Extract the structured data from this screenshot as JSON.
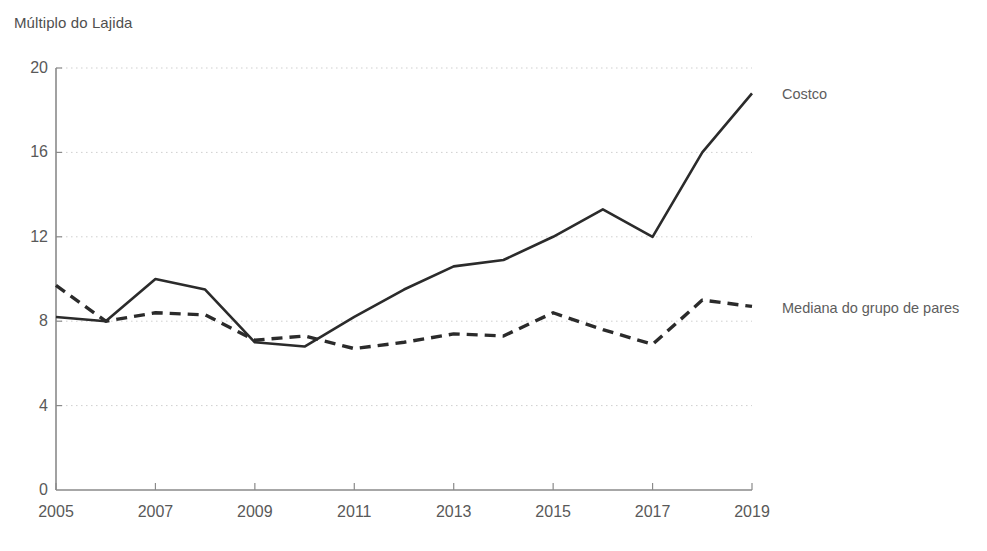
{
  "axis_title": "Múltiplo do Lajida",
  "series_labels": {
    "costco": "Costco",
    "peers": "Mediana do grupo de pares"
  },
  "colors": {
    "line": "#2b2b2b",
    "grid": "#cfcfcf",
    "axis": "#8a8a8a",
    "text": "#575757"
  },
  "chart_data": {
    "type": "line",
    "title": "Múltiplo do Lajida",
    "xlabel": "",
    "ylabel": "Múltiplo do Lajida",
    "x": [
      2005,
      2006,
      2007,
      2008,
      2009,
      2010,
      2011,
      2012,
      2013,
      2014,
      2015,
      2016,
      2017,
      2018,
      2019
    ],
    "xtick_labels": [
      "2005",
      "2007",
      "2009",
      "2011",
      "2013",
      "2015",
      "2017",
      "2019"
    ],
    "xticks": [
      2005,
      2007,
      2009,
      2011,
      2013,
      2015,
      2017,
      2019
    ],
    "ytick_labels": [
      "0",
      "4",
      "8",
      "12",
      "16",
      "20"
    ],
    "yticks": [
      0,
      4,
      8,
      12,
      16,
      20
    ],
    "xlim": [
      2005,
      2019
    ],
    "ylim": [
      0,
      20
    ],
    "grid": "horizontal-dotted",
    "legend": "right-inline-labels",
    "series": [
      {
        "name": "Costco",
        "style": "solid",
        "values": [
          8.2,
          8.0,
          10.0,
          9.5,
          7.0,
          6.8,
          8.2,
          9.5,
          10.6,
          10.9,
          12.0,
          13.3,
          12.0,
          16.0,
          18.8
        ]
      },
      {
        "name": "Mediana do grupo de pares",
        "style": "dashed",
        "values": [
          9.7,
          8.0,
          8.4,
          8.3,
          7.1,
          7.3,
          6.7,
          7.0,
          7.4,
          7.3,
          8.4,
          7.6,
          6.9,
          9.0,
          8.7
        ]
      }
    ]
  }
}
